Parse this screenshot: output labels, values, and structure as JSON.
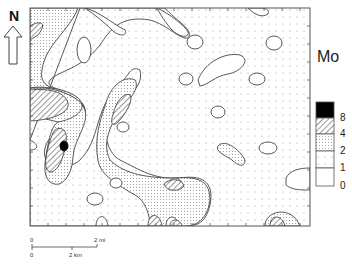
{
  "map": {
    "title": "Mo",
    "north_label": "N",
    "legend": {
      "title": "Mo",
      "classes": [
        {
          "pattern": "solid-black",
          "range": ">8"
        },
        {
          "pattern": "diagonal-hatch",
          "range": "4-8"
        },
        {
          "pattern": "dense-dots",
          "range": "2-4"
        },
        {
          "pattern": "sparse-dots",
          "range": "1-2"
        },
        {
          "pattern": "blank",
          "range": "0-1"
        }
      ],
      "break_labels": [
        "8",
        "4",
        "2",
        "1",
        "0"
      ]
    },
    "scale_bar": {
      "top_labels": [
        "0",
        "2 mi"
      ],
      "bottom_labels": [
        "0",
        "2 km"
      ]
    },
    "colors": {
      "frame": "#555555",
      "contour": "#444444",
      "fill_black": "#000000",
      "background": "#ffffff"
    }
  }
}
